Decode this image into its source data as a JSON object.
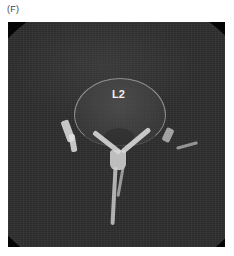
{
  "figure": {
    "panel_label": "(F)",
    "image": {
      "type": "axial CT scan",
      "annotation": "L2",
      "colors": {
        "background": "#ffffff",
        "scan_tissue": "#2e2e2e",
        "scan_outside_fov": "#050505",
        "bone": "#e1e1e1",
        "annotation_text": "#f2f2f2"
      }
    }
  }
}
